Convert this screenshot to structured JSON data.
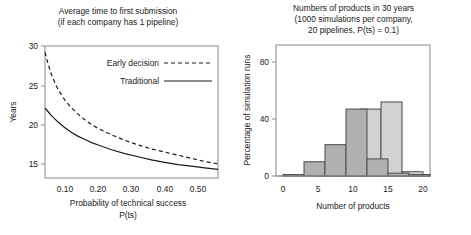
{
  "figure": {
    "background": "#ffffff",
    "ink": "#1a1a1a"
  },
  "chart_data": [
    {
      "id": "left",
      "type": "line",
      "title": "Average time to first submission",
      "subtitle": "(if each company has 1 pipeline)",
      "title_lines": [
        "Average time to first submission",
        "(if each company has 1 pipeline)"
      ],
      "xlabel": "Probability of technical success",
      "xlabel_line2": "P(ts)",
      "ylabel": "Years",
      "xlim": [
        0.04,
        0.56
      ],
      "ylim": [
        13.2,
        30.0
      ],
      "xticks": [
        0.1,
        0.2,
        0.3,
        0.4,
        0.5
      ],
      "xtick_labels": [
        "0.10",
        "0.20",
        "0.30",
        "0.40",
        "0.50"
      ],
      "yticks": [
        15,
        20,
        25,
        30
      ],
      "ytick_labels": [
        "15",
        "20",
        "25",
        "30"
      ],
      "grid": false,
      "legend_position": "upper-right-inside",
      "series": [
        {
          "name": "Early decision",
          "style": "dashed",
          "color": "#1a1a1a",
          "x": [
            0.04,
            0.05,
            0.06,
            0.07,
            0.08,
            0.1,
            0.12,
            0.14,
            0.16,
            0.18,
            0.2,
            0.24,
            0.28,
            0.32,
            0.36,
            0.4,
            0.44,
            0.48,
            0.52,
            0.56
          ],
          "y": [
            29.2,
            27.6,
            26.3,
            25.3,
            24.4,
            23.1,
            22.1,
            21.3,
            20.6,
            20.0,
            19.5,
            18.7,
            18.0,
            17.4,
            16.9,
            16.5,
            16.1,
            15.7,
            15.3,
            15.0
          ]
        },
        {
          "name": "Traditional",
          "style": "solid",
          "color": "#1a1a1a",
          "x": [
            0.04,
            0.05,
            0.06,
            0.07,
            0.08,
            0.1,
            0.12,
            0.14,
            0.16,
            0.18,
            0.2,
            0.24,
            0.28,
            0.32,
            0.36,
            0.4,
            0.44,
            0.48,
            0.52,
            0.56
          ],
          "y": [
            22.1,
            21.6,
            21.1,
            20.7,
            20.3,
            19.6,
            19.0,
            18.5,
            18.1,
            17.7,
            17.4,
            16.8,
            16.3,
            15.9,
            15.5,
            15.2,
            14.9,
            14.7,
            14.5,
            14.3
          ]
        }
      ],
      "legend": [
        {
          "label": "Early decision",
          "style": "dashed"
        },
        {
          "label": "Traditional",
          "style": "solid"
        }
      ]
    },
    {
      "id": "right",
      "type": "bar",
      "title_lines": [
        "Numbers of products in 30 years",
        "(1000 simulations per company,",
        "20 pipelines, P(ts) = 0.1)"
      ],
      "xlabel": "Number of products",
      "ylabel": "Percentage of simulation runs",
      "xlim": [
        -1,
        21
      ],
      "ylim": [
        0,
        92
      ],
      "xticks": [
        0,
        5,
        10,
        15,
        20
      ],
      "xtick_labels": [
        "0",
        "5",
        "10",
        "15",
        "20"
      ],
      "yticks": [
        0,
        40,
        80
      ],
      "ytick_labels": [
        "0",
        "40",
        "80"
      ],
      "grid": false,
      "bin_width": 3,
      "series": [
        {
          "name": "series-dark",
          "fill": "#b0b0b0",
          "edge": "#4a4a4a",
          "bin_starts": [
            0,
            3,
            6,
            9,
            12,
            15,
            18
          ],
          "values": [
            1,
            10,
            22,
            47,
            12,
            2,
            1
          ]
        },
        {
          "name": "series-light",
          "fill": "#d2d2d2",
          "edge": "#4a4a4a",
          "bin_starts": [
            -1,
            2,
            5,
            8,
            11,
            14,
            17,
            20
          ],
          "values": [
            0,
            0,
            1,
            1,
            47,
            52,
            3,
            1
          ]
        }
      ]
    }
  ]
}
